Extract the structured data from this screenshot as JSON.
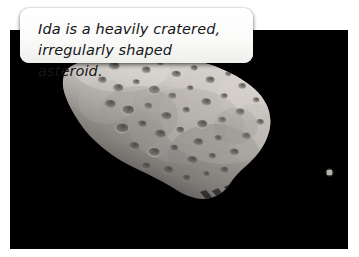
{
  "page": {
    "width": 359,
    "height": 257,
    "background_color": "#ffffff"
  },
  "caption": {
    "line1": "Ida is a heavily cratered,",
    "line2": "irregularly shaped asteroid.",
    "full_text": "Ida is a heavily cratered, irregularly shaped asteroid.",
    "style": "italic",
    "text_color": "#15151a",
    "box_color": "#fbfbfa"
  },
  "photo": {
    "background_color": "#000000",
    "subject": "asteroid-ida",
    "subject_description": "Heavily cratered, irregularly shaped elongated asteroid lit from the upper right",
    "moon": {
      "name": "dactyl",
      "description": "small bright companion point of light at right of frame",
      "x": 319,
      "y": 142,
      "size": 6
    },
    "lighting": "upper-right",
    "highlight_color": "#d8d6d2",
    "midtone_color": "#9b9894",
    "shadow_color": "#1a1a1a"
  }
}
